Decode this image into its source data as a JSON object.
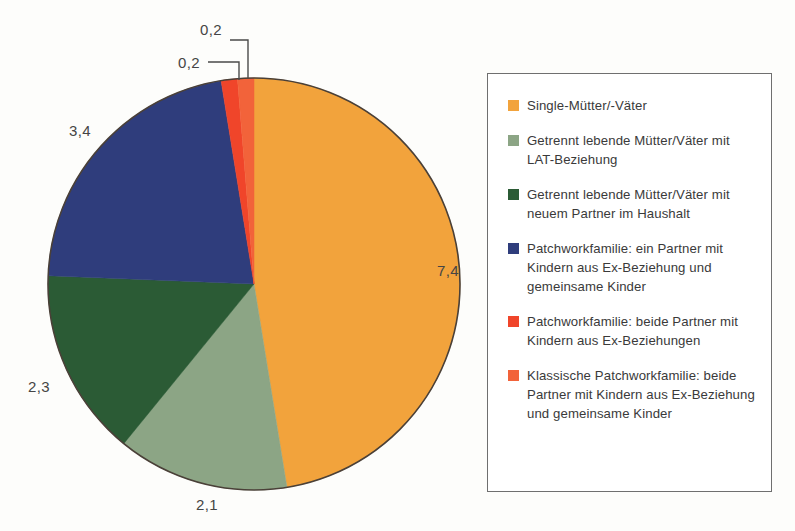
{
  "chart_data": {
    "type": "pie",
    "title": "",
    "subtitle": "",
    "xlabel": "",
    "ylabel": "",
    "legend_position": "right",
    "grid": false,
    "value_format": "german-decimal-comma",
    "total": "15,6",
    "categories": [
      "Single-Mütter/-Väter",
      "Getrennt lebende Mütter/Väter mit LAT-Beziehung",
      "Getrennt lebende Mütter/Väter mit neuem Partner im Haushalt",
      "Patchworkfamilie: ein Partner mit Kindern aus Ex-Beziehung und gemeinsame Kinder",
      "Patchworkfamilie: beide Partner mit Kindern aus Ex-Beziehungen",
      "Klassische Patchworkfamilie: beide Partner mit Kindern aus Ex-Beziehung und gemeinsame Kinder"
    ],
    "values": [
      7.4,
      2.1,
      2.3,
      3.4,
      0.2,
      0.2
    ],
    "value_labels": [
      "7,4",
      "2,1",
      "2,3",
      "3,4",
      "0,2",
      "0,2"
    ],
    "colors": [
      "#F2A33C",
      "#8CA585",
      "#2B5B35",
      "#2F3D7C",
      "#F0452A",
      "#F2633A"
    ],
    "slices": [
      {
        "label": "7,4",
        "value": 7.4,
        "color": "#F2A33C",
        "start_angle": 0.0,
        "end_angle": 170.8
      },
      {
        "label": "2,1",
        "value": 2.1,
        "color": "#8CA585",
        "start_angle": 170.8,
        "end_angle": 219.2
      },
      {
        "label": "2,3",
        "value": 2.3,
        "color": "#2B5B35",
        "start_angle": 219.2,
        "end_angle": 272.3
      },
      {
        "label": "3,4",
        "value": 3.4,
        "color": "#2F3D7C",
        "start_angle": 272.3,
        "end_angle": 350.8
      },
      {
        "label": "0,2",
        "value": 0.2,
        "color": "#F0452A",
        "start_angle": 350.8,
        "end_angle": 355.4
      },
      {
        "label": "0,2",
        "value": 0.2,
        "color": "#F2633A",
        "start_angle": 355.4,
        "end_angle": 360.0
      }
    ]
  },
  "pie": {
    "labels": {
      "right": "7,4",
      "bottom": "2,1",
      "left_lower": "2,3",
      "left_upper": "3,4",
      "top_outer": "0,2",
      "top_inner": "0,2"
    }
  },
  "legend": {
    "items": [
      {
        "color": "#F2A33C",
        "label": "Single-Mütter/-Väter"
      },
      {
        "color": "#8CA585",
        "label": "Getrennt lebende Mütter/Väter mit LAT-Beziehung"
      },
      {
        "color": "#2B5B35",
        "label": "Getrennt lebende Mütter/Väter mit neuem Partner im Haushalt"
      },
      {
        "color": "#2F3D7C",
        "label": "Patchworkfamilie: ein Partner mit Kindern aus Ex-Beziehung und gemeinsame Kinder"
      },
      {
        "color": "#F0452A",
        "label": "Patchworkfamilie: beide Partner mit Kindern aus Ex-Beziehungen"
      },
      {
        "color": "#F2633A",
        "label": "Klassische Patchworkfamilie: beide Partner mit Kindern aus Ex-Beziehung und gemeinsame Kinder"
      }
    ]
  }
}
